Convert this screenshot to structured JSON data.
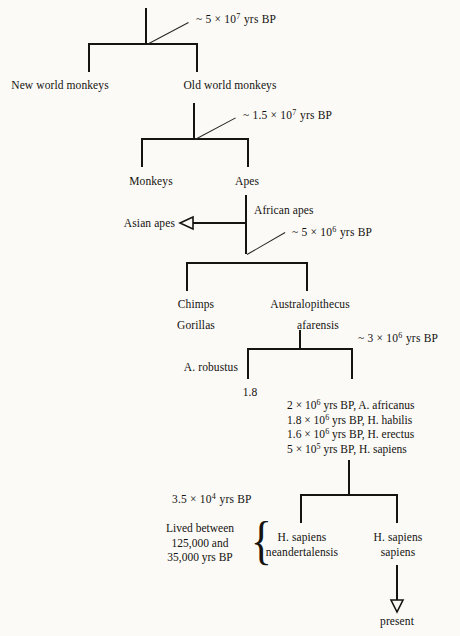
{
  "diagram": {
    "type": "phylogenetic-tree",
    "background_color": "#fbfaf7",
    "line_color": "#17140f"
  },
  "nodes": {
    "root_age": "~ 5 × 10",
    "root_age_exp": "7",
    "root_age_suffix": "yrs BP",
    "new_world_monkeys": "New world monkeys",
    "old_world_monkeys": "Old world monkeys",
    "second_age": "~ 1.5 × 10",
    "second_age_exp": "7",
    "second_age_suffix": "yrs BP",
    "monkeys": "Monkeys",
    "apes": "Apes",
    "asian_apes": "Asian apes",
    "african_apes": "African apes",
    "third_age": "~ 5 × 10",
    "third_age_exp": "6",
    "third_age_suffix": "yrs BP",
    "chimps": "Chimps",
    "gorillas": "Gorillas",
    "australopithecus": "Australopithecus",
    "afarensis": "afarensis",
    "fourth_age": "~ 3 × 10",
    "fourth_age_exp": "6",
    "fourth_age_suffix": "yrs BP",
    "a_robustus": "A. robustus",
    "robustus_value": "1.8",
    "fifth_age": "3.5 × 10",
    "fifth_age_exp": "4",
    "fifth_age_suffix": "yrs BP",
    "neandertalensis_line1": "H. sapiens",
    "neandertalensis_line2": "neandertalensis",
    "sapiens_line1": "H. sapiens",
    "sapiens_line2": "sapiens",
    "present": "present"
  },
  "species_events": [
    {
      "value": "2",
      "mult": "× 10",
      "exp": "6",
      "unit": "yrs BP,",
      "name": "A. africanus"
    },
    {
      "value": "1.8",
      "mult": "× 10",
      "exp": "6",
      "unit": "yrs BP,",
      "name": "H. habilis"
    },
    {
      "value": "1.6",
      "mult": "× 10",
      "exp": "6",
      "unit": "yrs BP,",
      "name": "H. erectus"
    },
    {
      "value": "5",
      "mult": "× 10",
      "exp": "5",
      "unit": "yrs BP,",
      "name": "H. sapiens"
    }
  ],
  "lived_note": {
    "line1": "Lived between",
    "line2": "125,000 and",
    "line3": "35,000 yrs BP"
  },
  "symbols": {
    "brace": "{"
  }
}
